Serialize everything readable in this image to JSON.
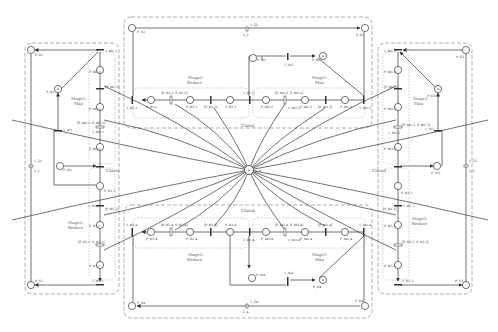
{
  "diagram": {
    "colors": {
      "line": "#333333",
      "class_border": "#999999",
      "stage_border": "#aaaaaa",
      "place_fill": "#ffffff",
      "background": "#ffffff"
    },
    "center": {
      "place_label": "4",
      "place_token_label": "p_R"
    },
    "classes": [
      {
        "id": "class1",
        "label": "Class1",
        "stages": [
          {
            "label_line1": "Stage1:",
            "label_line2": "Map"
          },
          {
            "label_line1": "Stage2:",
            "label_line2": "Reduce"
          }
        ],
        "start_place": "P_S1",
        "end_place": "P_E1",
        "delay_transition": "T_Z1",
        "delay_label": "λ_1",
        "think_place": "P_R1",
        "think_place_tokens": "4",
        "wait_place": "P_W1",
        "wait_transition": "T_W1",
        "map_places": [
          "P_M1,1",
          "P_M2,1",
          "P_M3,1"
        ],
        "map_transitions": [
          "T_M1,1",
          "[θ_M1,1]",
          "[θ_M2,1, δ_M2,1]",
          "T_M3,1"
        ],
        "reduce_places": [
          "P_R1,1",
          "P_R2,1",
          "P_R3,1"
        ],
        "reduce_transitions": [
          "T_R1,1",
          "[θ_R1,1]",
          "[θ_R2,1, δ_R2,1]",
          "T_R3,1"
        ]
      },
      {
        "id": "class2",
        "label": "Class2",
        "stages": [
          {
            "label_line1": "Stage2:",
            "label_line2": "Reduce"
          },
          {
            "label_line1": "Stage1:",
            "label_line2": "Map"
          }
        ],
        "start_place": "P_S2",
        "end_place": "P_E2",
        "delay_transition": "T_Z2",
        "delay_label": "λ_2",
        "think_place": "P_R2",
        "think_place_tokens": "4",
        "wait_place": "P_W2",
        "wait_transition": "T_W2",
        "map_places": [
          "P_M1,2",
          "P_M2,2",
          "P_M3,2"
        ],
        "map_transitions": [
          "T_M1,2",
          "[θ_M1,2]",
          "[θ_M2,2, δ_M2,2]",
          "T_M3,2"
        ],
        "reduce_places": [
          "P_R1,2",
          "P_R2,2",
          "P_R3,2"
        ],
        "reduce_transitions": [
          "T_R1,2",
          "[θ_R1,2]",
          "[θ_R2,2, δ_R2,2]",
          "T_R3,2"
        ]
      },
      {
        "id": "class3",
        "label": "Class3",
        "stages": [
          {
            "label_line1": "Stage1:",
            "label_line2": "Map"
          },
          {
            "label_line1": "Stage2:",
            "label_line2": "Reduce"
          }
        ],
        "start_place": "P_S3",
        "end_place": "P_E3",
        "delay_transition": "T_Z3",
        "delay_label": "λ_3",
        "think_place": "P_R3",
        "think_place_tokens": "4",
        "wait_place": "P_W3",
        "wait_transition": "T_W3",
        "map_places": [
          "P_M1,3",
          "P_M2,3",
          "P_M3,3"
        ],
        "map_transitions": [
          "T_M1,3",
          "[θ_M1,3]",
          "[θ_M2,3, δ_M2,3]",
          "T_M3,3"
        ],
        "reduce_places": [
          "P_R1,3",
          "P_R2,3",
          "P_R3,3"
        ],
        "reduce_transitions": [
          "T_R1,3",
          "[θ_R1,3]",
          "[θ_R2,3, δ_R2,3]",
          "T_R3,3"
        ]
      },
      {
        "id": "class4",
        "label": "Class4",
        "stages": [
          {
            "label_line1": "Stage2:",
            "label_line2": "Reduce"
          },
          {
            "label_line1": "Stage1:",
            "label_line2": "Map"
          }
        ],
        "start_place": "P_S4",
        "end_place": "P_E4",
        "delay_transition": "T_Z4",
        "delay_label": "λ_4",
        "think_place": "P_R4",
        "think_place_tokens": "4",
        "wait_place": "P_W4",
        "wait_transition": "T_W4",
        "map_places": [
          "P_M1,4",
          "P_M2,4",
          "P_M3,4"
        ],
        "map_transitions": [
          "T_M1,4",
          "[θ_M1,4]",
          "[θ_M2,4, δ_M2,4]",
          "T_M3,4"
        ],
        "reduce_places": [
          "P_R1,4",
          "P_R2,4",
          "P_R3,4"
        ],
        "reduce_transitions": [
          "T_R1,4",
          "[θ_R1,4]",
          "[θ_R2,4, δ_R2,4]",
          "T_R3,4"
        ]
      }
    ]
  }
}
